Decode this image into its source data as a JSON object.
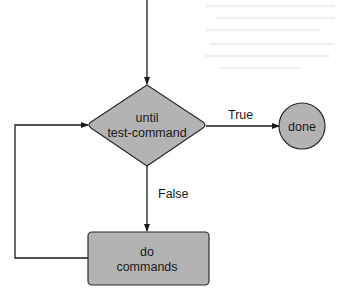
{
  "diagram": {
    "type": "flowchart",
    "colors": {
      "node_fill": "#b3b3b3",
      "node_stroke": "#2b2b2b",
      "edge_stroke": "#1a1a1a",
      "text": "#1a1a1a",
      "background": "#ffffff"
    },
    "nodes": [
      {
        "id": "decision",
        "shape": "diamond",
        "lines": [
          "until",
          "test-command"
        ]
      },
      {
        "id": "done",
        "shape": "circle",
        "lines": [
          "done"
        ]
      },
      {
        "id": "body",
        "shape": "rounded-rectangle",
        "lines": [
          "do",
          "commands"
        ]
      }
    ],
    "edges": [
      {
        "from": "entry",
        "to": "decision",
        "label": ""
      },
      {
        "from": "decision",
        "to": "done",
        "label": "True"
      },
      {
        "from": "decision",
        "to": "body",
        "label": "False"
      },
      {
        "from": "body",
        "to": "decision",
        "label": ""
      }
    ]
  }
}
